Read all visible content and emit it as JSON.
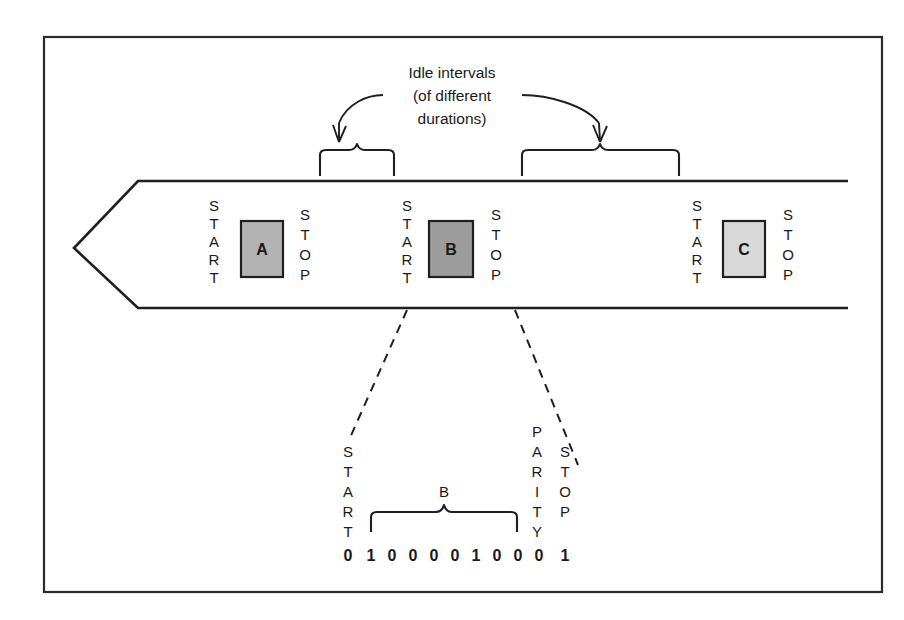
{
  "figure": {
    "frame": {
      "border_color": "#2b2b2b"
    }
  },
  "annotation": {
    "line1": "Idle intervals",
    "line2": "(of different",
    "line3": "durations)",
    "arrow_left_target": "idle-interval-1",
    "arrow_right_target": "idle-interval-2"
  },
  "stream": {
    "direction": "left",
    "characters": [
      {
        "id": "char-a",
        "start_label": "START",
        "stop_label": "STOP",
        "letter": "A",
        "fill": "#b3b3b3"
      },
      {
        "id": "char-b",
        "start_label": "START",
        "stop_label": "STOP",
        "letter": "B",
        "fill": "#9c9c9c"
      },
      {
        "id": "char-c",
        "start_label": "START",
        "stop_label": "STOP",
        "letter": "C",
        "fill": "#d9d9d9"
      }
    ]
  },
  "detail": {
    "start_label": "START",
    "parity_label": "PARITY",
    "stop_label": "STOP",
    "data_brace_label": "B",
    "start_bit": "0",
    "data_bits": [
      "1",
      "0",
      "0",
      "0",
      "0",
      "1",
      "0",
      "0"
    ],
    "parity_bit": "0",
    "stop_bit": "1",
    "all_bits": [
      "0",
      "1",
      "0",
      "0",
      "0",
      "0",
      "1",
      "0",
      "0",
      "0",
      "1"
    ]
  },
  "colors": {
    "ink": "#1f1f1f",
    "frame": "#2b2b2b",
    "box_a": "#b3b3b3",
    "box_b": "#9c9c9c",
    "box_c": "#d9d9d9"
  }
}
